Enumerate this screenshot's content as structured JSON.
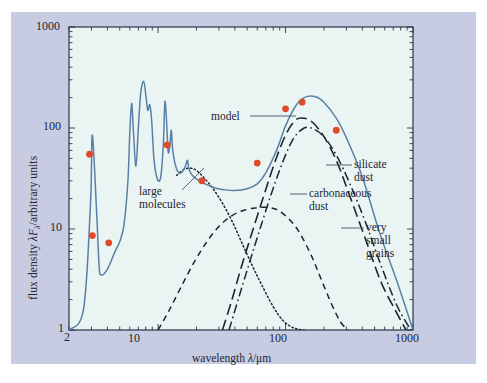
{
  "figure": {
    "background_color": "#c8cce3",
    "plot_background_color": "#eaf5f3",
    "frame_color": "#2b3347",
    "model_curve_color": "#5a7fa6",
    "data_point_color": "#e04a28"
  },
  "axes": {
    "x": {
      "label_prefix": "wavelength ",
      "label_symbol": "λ",
      "label_suffix": "/μm",
      "label_full": "wavelength λ/μm",
      "scale": "log",
      "min": 2,
      "max": 1000,
      "tick_labels": [
        "2",
        "10",
        "100",
        "1000"
      ],
      "tick_values": [
        2,
        10,
        100,
        1000
      ]
    },
    "y": {
      "label_full": "flux density λFλ/arbitrary units",
      "label_part1": "flux density ",
      "label_symbol1": "λ",
      "label_symbol2": "F",
      "label_sub": "λ",
      "label_part2": "/arbitrary units",
      "scale": "log",
      "min": 1,
      "max": 1000,
      "tick_labels": [
        "1",
        "10",
        "100",
        "1000"
      ],
      "tick_values": [
        1,
        10,
        100,
        1000
      ]
    }
  },
  "annotations": [
    {
      "name": "model",
      "text": "model",
      "lines": [
        "model"
      ]
    },
    {
      "name": "large-molecules",
      "text": "large molecules",
      "lines": [
        "large",
        "molecules"
      ]
    },
    {
      "name": "silicate-dust",
      "text": "silicate dust",
      "lines": [
        "silicate",
        "dust"
      ]
    },
    {
      "name": "carbonaceous-dust",
      "text": "carbonaceous dust",
      "lines": [
        "carbonaceous",
        "dust"
      ]
    },
    {
      "name": "very-small-grains",
      "text": "very small grains",
      "lines": [
        "very",
        "small",
        "grains"
      ]
    }
  ],
  "chart_data": {
    "type": "line",
    "title": "",
    "xlabel": "wavelength λ/μm",
    "ylabel": "flux density λFλ/arbitrary units",
    "xscale": "log",
    "yscale": "log",
    "xlim": [
      2,
      1000
    ],
    "ylim": [
      1,
      1000
    ],
    "grid": false,
    "legend": "inline-annotations",
    "series": [
      {
        "name": "model",
        "label": "model",
        "style": "solid",
        "color": "#5a7fa6",
        "description": "Total model spectral energy distribution: sum of all dust components plus PAH emission features.",
        "x": [
          2.0,
          2.6,
          2.95,
          3.05,
          3.3,
          3.45,
          3.6,
          4.0,
          4.6,
          5.0,
          5.4,
          5.8,
          6.0,
          6.2,
          6.4,
          6.7,
          7.0,
          7.3,
          7.7,
          8.0,
          8.3,
          8.6,
          8.9,
          9.3,
          9.9,
          10.5,
          11.0,
          11.3,
          11.6,
          12.0,
          12.4,
          12.7,
          13.0,
          13.6,
          14.5,
          15.5,
          16.4,
          17.0,
          17.4,
          18.0,
          19.0,
          21.0,
          24.0,
          28.0,
          33.0,
          40.0,
          50.0,
          60.0,
          70.0,
          85.0,
          100.0,
          120.0,
          140.0,
          170.0,
          200.0,
          250.0,
          300.0,
          400.0,
          550.0,
          750.0,
          1000.0
        ],
        "y": [
          1.0,
          1.6,
          18.0,
          85.0,
          14.0,
          4.2,
          3.5,
          4.0,
          6.0,
          7.5,
          11.0,
          30.0,
          90.0,
          175.0,
          95.0,
          42.0,
          100.0,
          220.0,
          290.0,
          215.0,
          150.0,
          170.0,
          120.0,
          48.0,
          31.0,
          33.0,
          70.0,
          180.0,
          130.0,
          58.0,
          70.0,
          95.0,
          62.0,
          44.0,
          36.0,
          37.0,
          42.0,
          48.0,
          40.0,
          36.0,
          33.0,
          30.0,
          27.5,
          25.5,
          24.5,
          24.0,
          25.0,
          28.0,
          36.0,
          60.0,
          105.0,
          165.0,
          200.0,
          205.0,
          180.0,
          125.0,
          80.0,
          33.0,
          9.0,
          3.0,
          1.0
        ]
      },
      {
        "name": "large molecules",
        "label": "large molecules",
        "style": "dotted",
        "color": "#1d2433",
        "description": "Large-molecule (PAH) continuum component, peaks near 18 μm and falls steeply beyond 60 μm.",
        "x": [
          14.0,
          16.0,
          18.0,
          20.0,
          23.0,
          27.0,
          32.0,
          38.0,
          45.0,
          55.0,
          65.0,
          80.0,
          95.0,
          110.0,
          125.0,
          140.0
        ],
        "y": [
          34.0,
          39.0,
          40.0,
          38.0,
          32.0,
          25.0,
          18.0,
          12.0,
          7.5,
          4.3,
          2.8,
          1.7,
          1.25,
          1.08,
          1.02,
          1.0
        ]
      },
      {
        "name": "very small grains",
        "label": "very small grains",
        "style": "dashed",
        "color": "#1d2433",
        "description": "Very small grain component, broad maximum near 60-90 μm.",
        "x": [
          10.0,
          12.0,
          15.0,
          19.0,
          24.0,
          30.0,
          38.0,
          48.0,
          60.0,
          75.0,
          90.0,
          110.0,
          130.0,
          160.0,
          190.0,
          230.0,
          270.0,
          310.0
        ],
        "y": [
          1.0,
          1.5,
          2.6,
          4.6,
          7.4,
          10.6,
          13.6,
          15.4,
          16.3,
          16.3,
          15.0,
          12.0,
          9.0,
          5.4,
          3.2,
          1.8,
          1.2,
          1.0
        ]
      },
      {
        "name": "carbonaceous dust",
        "label": "carbonaceous dust",
        "style": "long-dash",
        "color": "#1d2433",
        "description": "Carbonaceous (graphite) big-grain thermal emission, peak near 120 μm at ~125 units.",
        "x": [
          32.0,
          38.0,
          45.0,
          55.0,
          68.0,
          82.0,
          100.0,
          120.0,
          140.0,
          165.0,
          200.0,
          250.0,
          320.0,
          420.0,
          560.0,
          720.0,
          880.0
        ],
        "y": [
          1.0,
          2.0,
          4.2,
          9.5,
          22.0,
          45.0,
          85.0,
          120.0,
          125.0,
          112.0,
          82.0,
          48.0,
          21.0,
          8.2,
          3.0,
          1.6,
          1.0
        ]
      },
      {
        "name": "silicate dust",
        "label": "silicate dust",
        "style": "dash-dot",
        "color": "#1d2433",
        "description": "Silicate big-grain thermal emission, peak near 140 μm at ~100 units, extends to ~1000 μm.",
        "x": [
          36.0,
          43.0,
          52.0,
          63.0,
          78.0,
          95.0,
          115.0,
          140.0,
          165.0,
          200.0,
          250.0,
          320.0,
          420.0,
          560.0,
          740.0,
          920.0,
          1000.0
        ],
        "y": [
          1.0,
          2.1,
          4.6,
          10.0,
          23.0,
          46.0,
          78.0,
          100.0,
          98.0,
          82.0,
          54.0,
          28.0,
          12.0,
          4.4,
          1.8,
          1.1,
          1.0
        ]
      }
    ],
    "observed_points": {
      "name": "observations",
      "marker": "filled-circle",
      "color": "#e04a28",
      "x": [
        2.9,
        3.05,
        4.1,
        11.8,
        22.0,
        60.0,
        100.0,
        135.0,
        250.0
      ],
      "y": [
        55.0,
        8.6,
        7.3,
        68.0,
        30.0,
        45.0,
        155.0,
        180.0,
        95.0
      ]
    }
  }
}
